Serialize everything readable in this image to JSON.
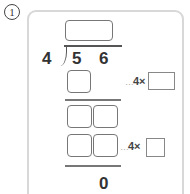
{
  "problem": {
    "number": "1",
    "divisor": "4",
    "dividend_digits": [
      "5",
      "6"
    ],
    "remainder": "0",
    "hints": [
      {
        "dots": "…",
        "text": "4×"
      },
      {
        "dots": "…",
        "text": "4×"
      }
    ]
  }
}
